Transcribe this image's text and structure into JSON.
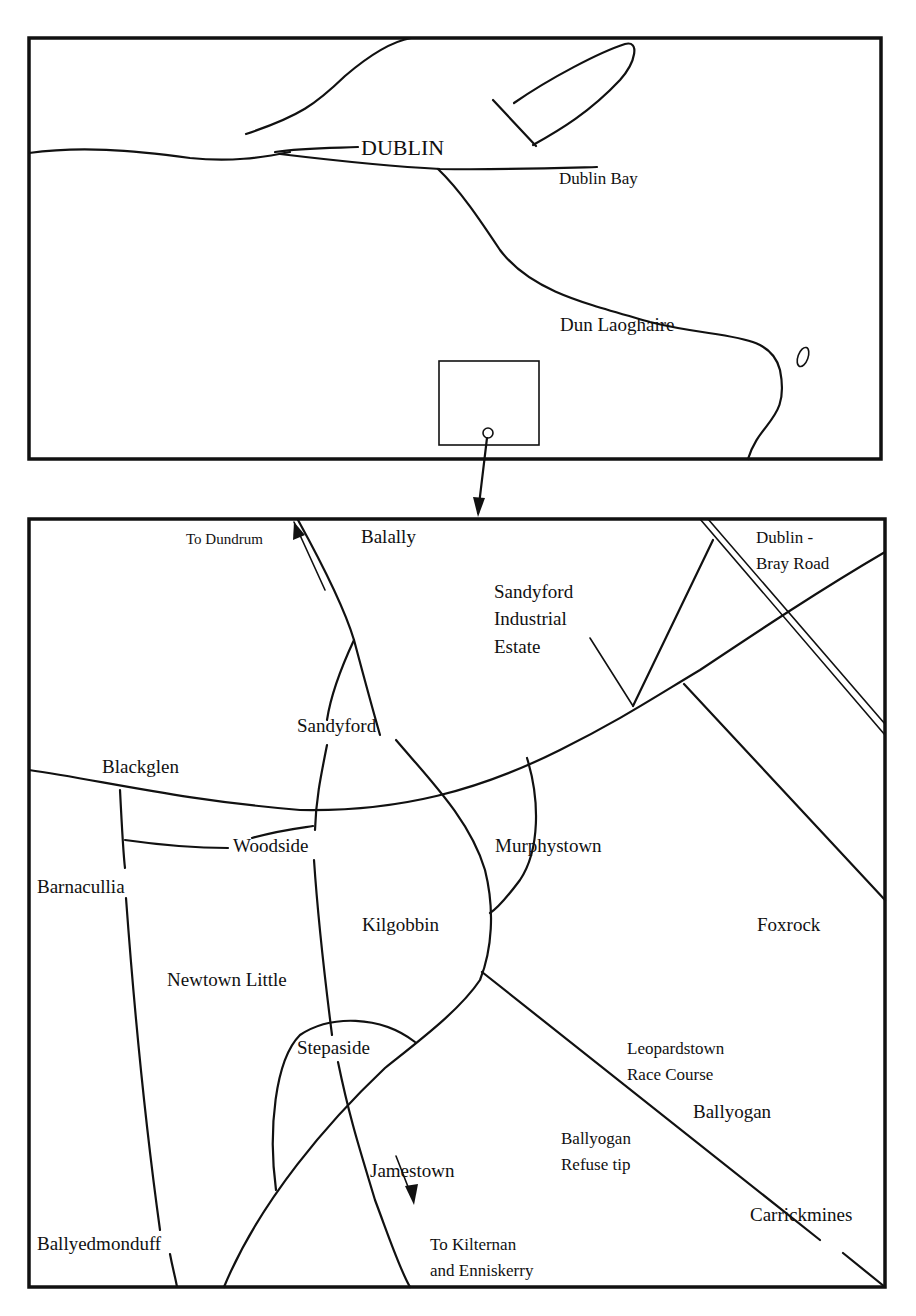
{
  "overview_map": {
    "labels": {
      "city": "DUBLIN",
      "bay": "Dublin Bay",
      "town": "Dun Laoghaire"
    }
  },
  "detail_map": {
    "labels": {
      "to_dundrum": "To Dundrum",
      "balally": "Balally",
      "dublin_bray_road_1": "Dublin -",
      "dublin_bray_road_2": "Bray Road",
      "sandyford_ie_1": "Sandyford",
      "sandyford_ie_2": "Industrial",
      "sandyford_ie_3": "Estate",
      "sandyford": "Sandyford",
      "blackglen": "Blackglen",
      "woodside": "Woodside",
      "murphystown": "Murphystown",
      "barnacullia": "Barnacullia",
      "kilgobbin": "Kilgobbin",
      "foxrock": "Foxrock",
      "newtown_little": "Newtown Little",
      "stepaside": "Stepaside",
      "leopardstown_1": "Leopardstown",
      "leopardstown_2": "Race Course",
      "ballyogan": "Ballyogan",
      "ballyogan_tip_1": "Ballyogan",
      "ballyogan_tip_2": "Refuse tip",
      "jamestown": "Jamestown",
      "carrickmines": "Carrickmines",
      "ballyedmonduff": "Ballyedmonduff",
      "to_kilternan_1": "To Kilternan",
      "to_kilternan_2": "and Enniskerry"
    }
  },
  "colors": {
    "ink": "#111111",
    "paper": "#ffffff"
  }
}
